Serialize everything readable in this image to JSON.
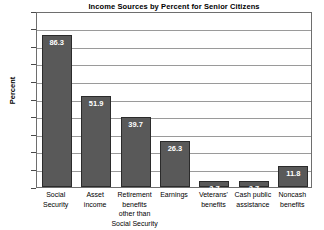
{
  "chart_data": {
    "type": "bar",
    "title": "Income Sources by Percent for Senior Citizens",
    "xlabel": "",
    "ylabel": "Percent",
    "ylim": [
      0,
      100
    ],
    "ytick_step": 10,
    "grid": true,
    "legend": null,
    "bar_color": "#595959",
    "bar_border_color": "#2b2b2b",
    "plot_background": "#ffffff",
    "gridline_color": "#9a9a9a",
    "categories": [
      "Social Security",
      "Asset income",
      "Retirement benefits other than Social Security",
      "Earnings",
      "Veterans' benefits",
      "Cash public assistance",
      "Noncash benefits"
    ],
    "values": [
      86.3,
      51.9,
      39.7,
      26.3,
      3.7,
      3.7,
      11.8
    ],
    "value_labels": [
      "86.3",
      "51.9",
      "39.7",
      "26.3",
      "3.7",
      "3.7",
      "11.8"
    ],
    "ytick_labels": [
      "100",
      "90",
      "80",
      "70",
      "60",
      "50",
      "40",
      "30",
      "20",
      "10",
      "0"
    ],
    "category_lines": [
      [
        "Social",
        "Security"
      ],
      [
        "Asset",
        "income"
      ],
      [
        "Retirement",
        "benefits",
        "other than",
        "Social Security"
      ],
      [
        "Earnings"
      ],
      [
        "Veterans'",
        "benefits"
      ],
      [
        "Cash public",
        "assistance"
      ],
      [
        "Noncash",
        "benefits"
      ]
    ]
  }
}
